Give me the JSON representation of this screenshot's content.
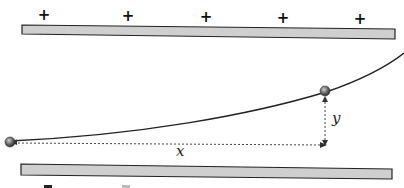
{
  "diagram": {
    "top_plate": {
      "charges": [
        "+",
        "+",
        "+",
        "+",
        "+"
      ],
      "color": "#cfcfcf"
    },
    "bottom_plate": {
      "color": "#cfcfcf"
    },
    "labels": {
      "x": "x",
      "y": "y"
    }
  }
}
